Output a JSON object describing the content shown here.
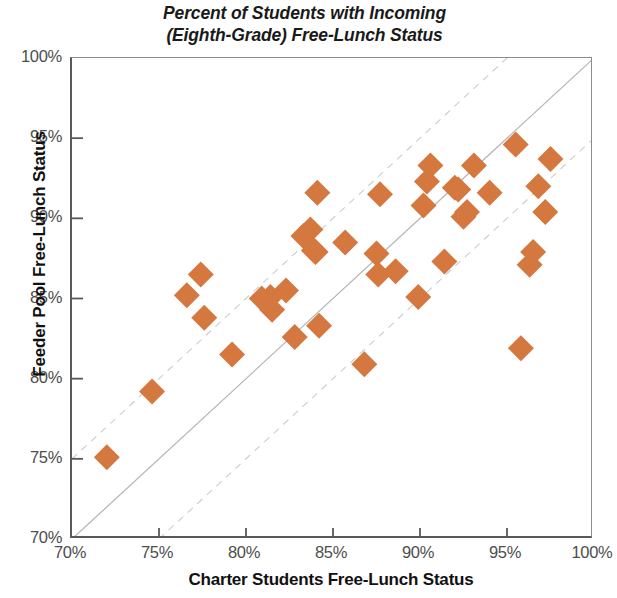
{
  "chart_data": {
    "type": "scatter",
    "title": "Percent of Students with Incoming\n(Eighth-Grade) Free-Lunch Status",
    "xlabel": "Charter Students Free-Lunch Status",
    "ylabel": "Feeder Pool Free-Lunch Status",
    "xlim": [
      70,
      100
    ],
    "ylim": [
      70,
      100
    ],
    "xticks": [
      "70%",
      "75%",
      "80%",
      "85%",
      "90%",
      "95%",
      "100%"
    ],
    "yticks": [
      "70%",
      "75%",
      "80%",
      "85%",
      "90%",
      "95%",
      "100%"
    ],
    "xtick_values": [
      70,
      75,
      80,
      85,
      90,
      95,
      100
    ],
    "ytick_values": [
      70,
      75,
      80,
      85,
      90,
      95,
      100
    ],
    "grid": false,
    "legend": "none",
    "marker": "diamond",
    "marker_color": "#d4783f",
    "marker_size": 13,
    "reference_lines": [
      {
        "name": "identity",
        "style": "solid",
        "color": "#b3b3b3",
        "intercept": 0
      },
      {
        "name": "plus-five",
        "style": "dashed",
        "color": "#cccccc",
        "intercept": 5
      },
      {
        "name": "minus-five",
        "style": "dashed",
        "color": "#cccccc",
        "intercept": -5
      }
    ],
    "points": [
      {
        "x": 72.0,
        "y": 75.1
      },
      {
        "x": 74.6,
        "y": 79.2
      },
      {
        "x": 76.6,
        "y": 85.2
      },
      {
        "x": 77.4,
        "y": 86.5
      },
      {
        "x": 77.6,
        "y": 83.8
      },
      {
        "x": 79.2,
        "y": 81.5
      },
      {
        "x": 80.9,
        "y": 85.0
      },
      {
        "x": 81.4,
        "y": 85.1
      },
      {
        "x": 81.5,
        "y": 84.3
      },
      {
        "x": 82.3,
        "y": 85.5
      },
      {
        "x": 82.8,
        "y": 82.6
      },
      {
        "x": 83.3,
        "y": 88.9
      },
      {
        "x": 83.7,
        "y": 89.3
      },
      {
        "x": 83.9,
        "y": 88.0
      },
      {
        "x": 84.1,
        "y": 91.6
      },
      {
        "x": 84.0,
        "y": 87.9
      },
      {
        "x": 84.2,
        "y": 83.3
      },
      {
        "x": 85.7,
        "y": 88.5
      },
      {
        "x": 86.8,
        "y": 80.9
      },
      {
        "x": 87.5,
        "y": 87.8
      },
      {
        "x": 87.7,
        "y": 91.5
      },
      {
        "x": 87.6,
        "y": 86.5
      },
      {
        "x": 88.6,
        "y": 86.7
      },
      {
        "x": 89.9,
        "y": 85.1
      },
      {
        "x": 90.2,
        "y": 90.8
      },
      {
        "x": 90.4,
        "y": 92.3
      },
      {
        "x": 90.6,
        "y": 93.3
      },
      {
        "x": 91.4,
        "y": 87.3
      },
      {
        "x": 92.0,
        "y": 91.9
      },
      {
        "x": 92.2,
        "y": 91.8
      },
      {
        "x": 92.5,
        "y": 90.1
      },
      {
        "x": 92.7,
        "y": 90.4
      },
      {
        "x": 93.1,
        "y": 93.3
      },
      {
        "x": 94.0,
        "y": 91.6
      },
      {
        "x": 95.5,
        "y": 94.6
      },
      {
        "x": 95.8,
        "y": 81.9
      },
      {
        "x": 96.3,
        "y": 87.1
      },
      {
        "x": 96.5,
        "y": 87.9
      },
      {
        "x": 96.8,
        "y": 92.0
      },
      {
        "x": 97.2,
        "y": 90.4
      },
      {
        "x": 97.5,
        "y": 93.7
      }
    ]
  }
}
